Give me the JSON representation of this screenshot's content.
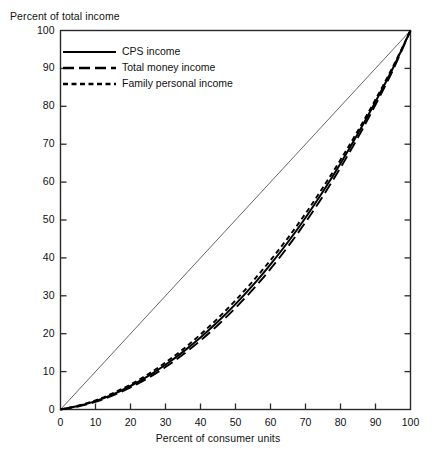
{
  "chart_data": {
    "type": "line",
    "title": "",
    "xlabel": "Percent of consumer units",
    "ylabel": "Percent of total income",
    "xlim": [
      0,
      100
    ],
    "ylim": [
      0,
      100
    ],
    "xticks": [
      0,
      10,
      20,
      30,
      40,
      50,
      60,
      70,
      80,
      90,
      100
    ],
    "yticks": [
      0,
      10,
      20,
      30,
      40,
      50,
      60,
      70,
      80,
      90,
      100
    ],
    "xticklabels": [
      "0",
      "10",
      "20",
      "30",
      "40",
      "50",
      "60",
      "70",
      "80",
      "90",
      "100"
    ],
    "yticklabels": [
      "0",
      "10",
      "20",
      "30",
      "40",
      "50",
      "60",
      "70",
      "80",
      "90",
      "100"
    ],
    "grid": false,
    "legend_position": "upper-left-inside",
    "reference_line": {
      "name": "line of equality",
      "x": [
        0,
        100
      ],
      "y": [
        0,
        100
      ],
      "style": "thin-solid",
      "color": "#555555"
    },
    "x": [
      0,
      5,
      10,
      15,
      20,
      25,
      30,
      35,
      40,
      45,
      50,
      55,
      60,
      65,
      70,
      75,
      80,
      85,
      90,
      95,
      100
    ],
    "series": [
      {
        "name": "CPS income",
        "style": "solid",
        "color": "#000000",
        "values": [
          0,
          0.9,
          2.2,
          4.0,
          6.2,
          8.8,
          11.8,
          15.2,
          19.0,
          23.2,
          27.8,
          32.8,
          38.3,
          44.2,
          50.6,
          57.5,
          64.9,
          72.8,
          81.2,
          90.1,
          100
        ]
      },
      {
        "name": "Total money income",
        "style": "long-dash",
        "color": "#000000",
        "values": [
          0,
          0.8,
          2.0,
          3.7,
          5.8,
          8.3,
          11.2,
          14.5,
          18.2,
          22.3,
          26.8,
          31.7,
          37.1,
          43.0,
          49.4,
          56.3,
          63.8,
          71.8,
          80.4,
          89.6,
          100
        ]
      },
      {
        "name": "Family personal income",
        "style": "short-dash",
        "color": "#000000",
        "values": [
          0,
          1.0,
          2.4,
          4.3,
          6.6,
          9.3,
          12.4,
          15.9,
          19.8,
          24.1,
          28.8,
          33.9,
          39.4,
          45.3,
          51.7,
          58.6,
          65.9,
          73.6,
          81.8,
          90.5,
          100
        ]
      }
    ]
  },
  "legend": {
    "entries": [
      {
        "label": "CPS income",
        "style": "solid"
      },
      {
        "label": "Total money income",
        "style": "long-dash"
      },
      {
        "label": "Family personal income",
        "style": "short-dash"
      }
    ]
  },
  "colors": {
    "ink": "#000000",
    "axis": "#2a2a2a",
    "reference": "#666666",
    "background": "#ffffff"
  }
}
